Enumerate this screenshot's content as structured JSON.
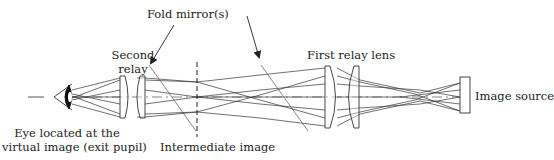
{
  "diagram": {
    "type": "optical-layout",
    "colors": {
      "line": "#333333",
      "text": "#222222",
      "background": "#ffffff"
    },
    "labels": {
      "fold_mirrors": "Fold mirror(s)",
      "second_relay_line1": "Second",
      "second_relay_line2": "relay",
      "first_relay": "First relay lens",
      "image_source": "Image source",
      "eye_line1": "Eye located at the",
      "eye_line2": "virtual image (exit pupil)",
      "intermediate_image": "Intermediate image"
    },
    "components": [
      {
        "name": "eye",
        "x": 62
      },
      {
        "name": "second-relay-lens-1",
        "x": 124
      },
      {
        "name": "second-relay-lens-2",
        "x": 141
      },
      {
        "name": "fold-mirror-1",
        "x": 172
      },
      {
        "name": "intermediate-image",
        "x": 197
      },
      {
        "name": "fold-mirror-2",
        "x": 285
      },
      {
        "name": "first-relay-lens-1",
        "x": 331
      },
      {
        "name": "first-relay-lens-2",
        "x": 354
      },
      {
        "name": "image-source",
        "x": 465
      }
    ]
  }
}
